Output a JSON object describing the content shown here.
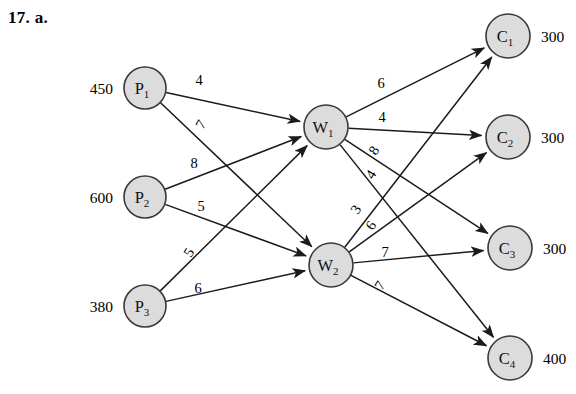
{
  "problem": {
    "number": "17.",
    "part": "a."
  },
  "diagram": {
    "type": "transshipment-network",
    "plants": [
      {
        "id": "P1",
        "label": "P",
        "sub": "1",
        "supply": "450",
        "cx": 145,
        "cy": 88,
        "r": 21
      },
      {
        "id": "P2",
        "label": "P",
        "sub": "2",
        "supply": "600",
        "cx": 145,
        "cy": 197,
        "r": 21
      },
      {
        "id": "P3",
        "label": "P",
        "sub": "3",
        "supply": "380",
        "cx": 145,
        "cy": 306,
        "r": 21
      }
    ],
    "warehouses": [
      {
        "id": "W1",
        "label": "W",
        "sub": "1",
        "cx": 326,
        "cy": 127,
        "r": 22
      },
      {
        "id": "W2",
        "label": "W",
        "sub": "2",
        "cx": 331,
        "cy": 265,
        "r": 22
      }
    ],
    "customers": [
      {
        "id": "C1",
        "label": "C",
        "sub": "1",
        "demand": "300",
        "cx": 508,
        "cy": 36,
        "r": 22
      },
      {
        "id": "C2",
        "label": "C",
        "sub": "2",
        "demand": "300",
        "cx": 508,
        "cy": 137,
        "r": 22
      },
      {
        "id": "C3",
        "label": "C",
        "sub": "3",
        "demand": "300",
        "cx": 510,
        "cy": 248,
        "r": 22
      },
      {
        "id": "C4",
        "label": "C",
        "sub": "4",
        "demand": "400",
        "cx": 510,
        "cy": 358,
        "r": 22
      }
    ],
    "edges": [
      {
        "id": "P1-W1",
        "from": "P1",
        "to": "W1",
        "cost": "4",
        "lx": 199,
        "ly": 85,
        "rot": 0
      },
      {
        "id": "P1-W2",
        "from": "P1",
        "to": "W2",
        "cost": "7",
        "lx": 205,
        "ly": 127,
        "rot": -58
      },
      {
        "id": "P2-W1",
        "from": "P2",
        "to": "W1",
        "cost": "8",
        "lx": 194,
        "ly": 168,
        "rot": 0
      },
      {
        "id": "P2-W2",
        "from": "P2",
        "to": "W2",
        "cost": "5",
        "lx": 201,
        "ly": 211,
        "rot": 0
      },
      {
        "id": "P3-W1",
        "from": "P3",
        "to": "W1",
        "cost": "5",
        "lx": 193,
        "ly": 255,
        "rot": -58
      },
      {
        "id": "P3-W2",
        "from": "P3",
        "to": "W2",
        "cost": "6",
        "lx": 198,
        "ly": 293,
        "rot": 0
      },
      {
        "id": "W1-C1",
        "from": "W1",
        "to": "C1",
        "cost": "6",
        "lx": 381,
        "ly": 88,
        "rot": 0
      },
      {
        "id": "W1-C2",
        "from": "W1",
        "to": "C2",
        "cost": "4",
        "lx": 382,
        "ly": 122,
        "rot": 0
      },
      {
        "id": "W1-C3",
        "from": "W1",
        "to": "C3",
        "cost": "8",
        "lx": 378,
        "ly": 153,
        "rot": -58
      },
      {
        "id": "W1-C4",
        "from": "W1",
        "to": "C4",
        "cost": "4",
        "lx": 375,
        "ly": 177,
        "rot": -58
      },
      {
        "id": "W2-C1",
        "from": "W2",
        "to": "C1",
        "cost": "3",
        "lx": 360,
        "ly": 212,
        "rot": -58
      },
      {
        "id": "W2-C2",
        "from": "W2",
        "to": "C2",
        "cost": "6",
        "lx": 375,
        "ly": 228,
        "rot": -58
      },
      {
        "id": "W2-C3",
        "from": "W2",
        "to": "C3",
        "cost": "7",
        "lx": 385,
        "ly": 257,
        "rot": 0
      },
      {
        "id": "W2-C4",
        "from": "W2",
        "to": "C4",
        "cost": "7",
        "lx": 384,
        "ly": 288,
        "rot": -58
      }
    ]
  }
}
